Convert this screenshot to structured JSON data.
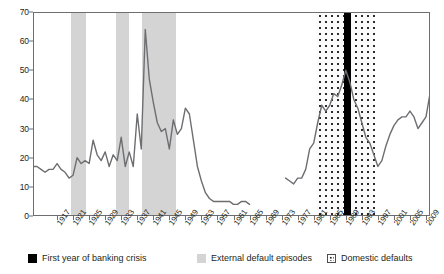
{
  "chart_data": {
    "type": "line",
    "title": "",
    "xlabel": "",
    "ylabel": "",
    "ylim": [
      0,
      70
    ],
    "ytick_values": [
      0,
      10,
      20,
      30,
      40,
      50,
      60,
      70
    ],
    "xlim": [
      1911,
      2010
    ],
    "xtick_labels": [
      "1917",
      "1921",
      "1925",
      "1929",
      "1933",
      "1937",
      "1941",
      "1945",
      "1949",
      "1953",
      "1957",
      "1961",
      "1965",
      "1969",
      "1973",
      "1977",
      "1981",
      "1985",
      "1989",
      "1993",
      "1997",
      "2001",
      "2005",
      "2009"
    ],
    "grid": false,
    "legend_position": "bottom",
    "line_color": "#6d6e71",
    "series": [
      {
        "name": "Share of countries in default or restructuring",
        "x": [
          1911,
          1912,
          1913,
          1914,
          1915,
          1916,
          1917,
          1918,
          1919,
          1920,
          1921,
          1922,
          1923,
          1924,
          1925,
          1926,
          1927,
          1928,
          1929,
          1930,
          1931,
          1932,
          1933,
          1934,
          1935,
          1936,
          1937,
          1938,
          1939,
          1940,
          1941,
          1942,
          1943,
          1944,
          1945,
          1946,
          1947,
          1948,
          1949,
          1950,
          1951,
          1952,
          1953,
          1954,
          1955,
          1956,
          1957,
          1958,
          1959,
          1960,
          1961,
          1962,
          1963,
          1964,
          1965
        ],
        "values": [
          17,
          17,
          16,
          15,
          16,
          16,
          18,
          16,
          15,
          13,
          14,
          20,
          18,
          19,
          18,
          26,
          21,
          19,
          22,
          17,
          21,
          19,
          27,
          17,
          22,
          17,
          35,
          23,
          64,
          47,
          39,
          32,
          29,
          30,
          23,
          33,
          28,
          30,
          37,
          35,
          26,
          17,
          12,
          8,
          6,
          5,
          5,
          5,
          5,
          5,
          4,
          4,
          5,
          5,
          4
        ]
      },
      {
        "name": "Share of countries in default or restructuring (resumed)",
        "x": [
          1974,
          1975,
          1976,
          1977,
          1978,
          1979,
          1980,
          1981,
          1982,
          1983,
          1984,
          1985,
          1986,
          1987,
          1988,
          1989,
          1990,
          1991,
          1992,
          1993,
          1994,
          1995,
          1996,
          1997,
          1998,
          1999,
          2000,
          2001,
          2002,
          2003,
          2004,
          2005,
          2006,
          2007,
          2008,
          2009,
          2010
        ],
        "values": [
          13,
          12,
          11,
          13,
          13,
          16,
          23,
          25,
          32,
          38,
          36,
          38,
          42,
          41,
          45,
          50,
          46,
          40,
          37,
          32,
          27,
          25,
          21,
          17,
          19,
          24,
          28,
          31,
          33,
          34,
          34,
          36,
          34,
          30,
          32,
          34,
          42
        ]
      }
    ],
    "bands": {
      "external_default_episodes": [
        {
          "start": 1920.5,
          "end": 1924.2
        },
        {
          "start": 1931.8,
          "end": 1935.0
        },
        {
          "start": 1938.2,
          "end": 1946.6
        }
      ],
      "domestic_defaults": [
        {
          "start": 1981.6,
          "end": 1996.4
        }
      ],
      "first_year_of_banking_crisis": [
        {
          "start": 1988.6,
          "end": 1990.2
        }
      ]
    },
    "annotations": []
  },
  "legend": {
    "items": [
      {
        "label": "First year of banking crisis",
        "marker": "crisis",
        "color": "#000000"
      },
      {
        "label": "External default episodes",
        "marker": "external",
        "color": "#d4d4d4"
      },
      {
        "label": "Domestic defaults",
        "marker": "domestic",
        "color": "#ffffff"
      }
    ]
  }
}
